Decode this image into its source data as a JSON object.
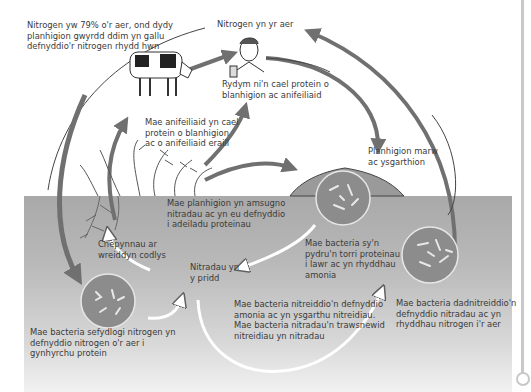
{
  "diagram": {
    "labels": {
      "air_fact": "Nitrogen yw 79% o'r aer, ond dydy\nplanhigion gwyrdd ddim yn gallu\ndefnyddio'r nitrogen rhydd hwn",
      "nitrogen_in_air": "Nitrogen yn yr aer",
      "humans": "Rydym ni'n cael protein o\nblanhigion ac anifeiliaid",
      "animals": "Mae anifeiliaid yn cael\nprotein o blanhigion\nac o anifeiliaid eraill",
      "dead_plants": "Planhigion marw\nac ysgarthion",
      "plants_absorb": "Mae planhigion yn amsugno\nnitradau ac yn eu defnyddio\ni adeiladu proteinau",
      "root_nodules": "Cnepynnau ar\nwreiddyn codlys",
      "decomposers": "Mae bacteria sy'n\npydru'n torri proteinau\ni lawr ac yn rhyddhau\namonia",
      "soil_nitrates": "Nitradau yn\ny pridd",
      "nitrifying": "Mae bacteria nitreiddio'n defnyddio\namonia ac yn ysgarthu nitreidiau.\nMae bacteria nitradau'n trawsnewid\nnitreidiau yn nitradau",
      "denitrifying": "Mae bacteria dadnitreiddio'n\ndefnyddio nitradau ac yn\nrhyddhau nitrogen i'r aer",
      "nitrogen_fixing": "Mae bacteria sefydlogi nitrogen yn\ndefnyddio nitrogen o'r aer i\ngynhyrchu protein"
    },
    "colors": {
      "soil": "#b0b0b0",
      "arrow": "#707070",
      "bacteria_fill": "#8c8c8c",
      "text": "#3a3a3a"
    }
  }
}
